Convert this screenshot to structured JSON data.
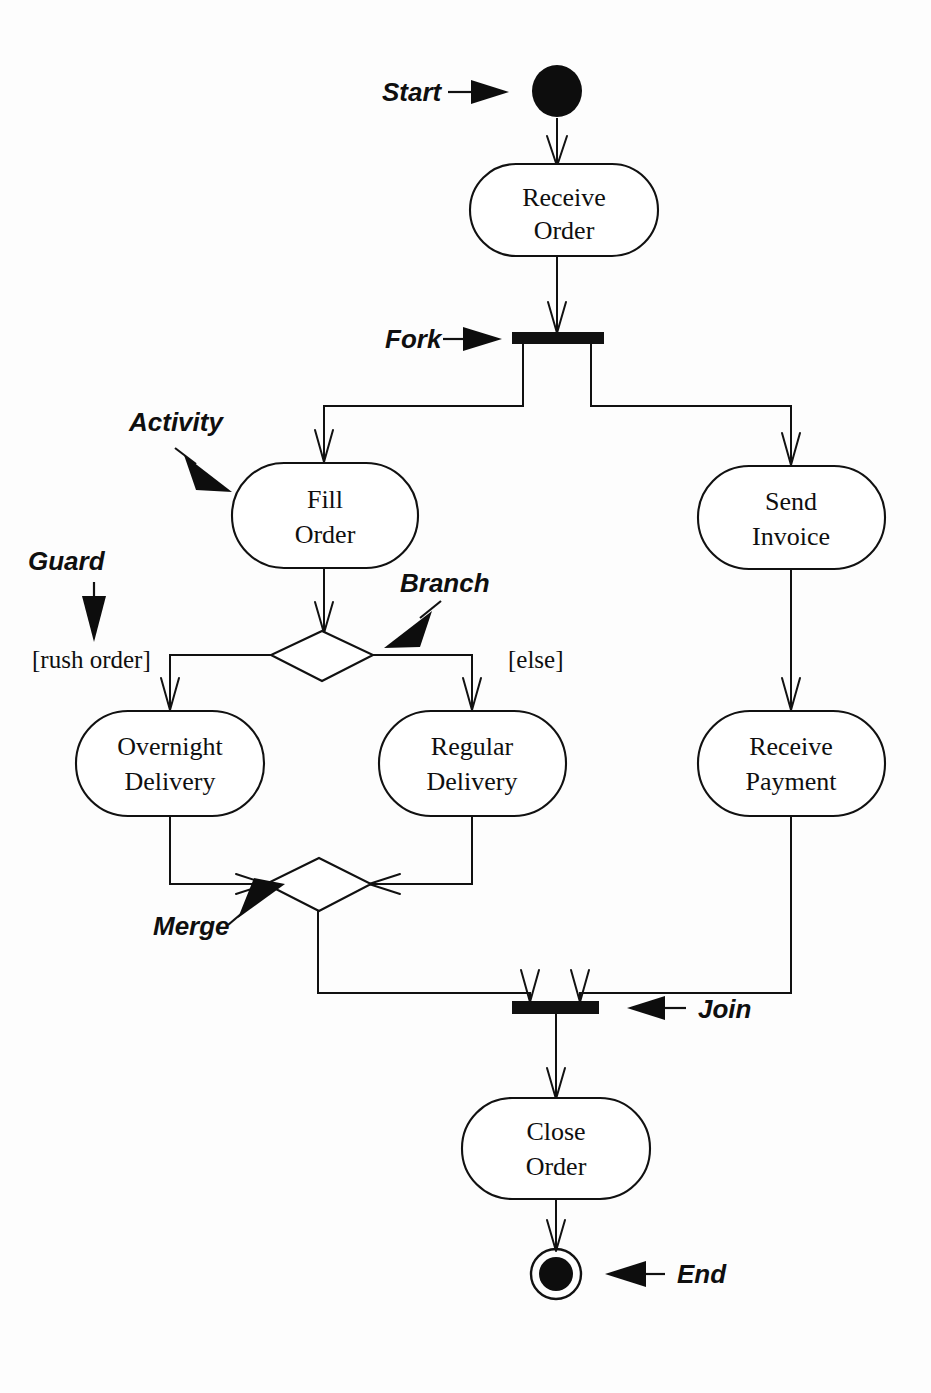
{
  "diagram": {
    "type": "uml-activity-diagram",
    "background_color": "#fdfdfd",
    "ink_color": "#111111",
    "width": 931,
    "height": 1393
  },
  "nodes": {
    "start": {
      "kind": "initial-node",
      "label": ""
    },
    "receive_order": {
      "kind": "activity",
      "label_line1": "Receive",
      "label_line2": "Order"
    },
    "fork": {
      "kind": "fork-bar",
      "label": ""
    },
    "fill_order": {
      "kind": "activity",
      "label_line1": "Fill",
      "label_line2": "Order"
    },
    "send_invoice": {
      "kind": "activity",
      "label_line1": "Send",
      "label_line2": "Invoice"
    },
    "branch": {
      "kind": "decision-diamond",
      "label": ""
    },
    "overnight_delivery": {
      "kind": "activity",
      "label_line1": "Overnight",
      "label_line2": "Delivery"
    },
    "regular_delivery": {
      "kind": "activity",
      "label_line1": "Regular",
      "label_line2": "Delivery"
    },
    "receive_payment": {
      "kind": "activity",
      "label_line1": "Receive",
      "label_line2": "Payment"
    },
    "merge": {
      "kind": "merge-diamond",
      "label": ""
    },
    "join": {
      "kind": "join-bar",
      "label": ""
    },
    "close_order": {
      "kind": "activity",
      "label_line1": "Close",
      "label_line2": "Order"
    },
    "end": {
      "kind": "final-node",
      "label": ""
    }
  },
  "guards": {
    "rush_order": "[rush order]",
    "else": "[else]"
  },
  "annotations": {
    "start": "Start",
    "fork": "Fork",
    "activity": "Activity",
    "guard": "Guard",
    "branch": "Branch",
    "merge": "Merge",
    "join": "Join",
    "end": "End"
  },
  "edges": [
    {
      "from": "start",
      "to": "receive_order"
    },
    {
      "from": "receive_order",
      "to": "fork"
    },
    {
      "from": "fork",
      "to": "fill_order"
    },
    {
      "from": "fork",
      "to": "send_invoice"
    },
    {
      "from": "fill_order",
      "to": "branch"
    },
    {
      "from": "branch",
      "to": "overnight_delivery",
      "guard": "[rush order]"
    },
    {
      "from": "branch",
      "to": "regular_delivery",
      "guard": "[else]"
    },
    {
      "from": "send_invoice",
      "to": "receive_payment"
    },
    {
      "from": "overnight_delivery",
      "to": "merge"
    },
    {
      "from": "regular_delivery",
      "to": "merge"
    },
    {
      "from": "merge",
      "to": "join"
    },
    {
      "from": "receive_payment",
      "to": "join"
    },
    {
      "from": "join",
      "to": "close_order"
    },
    {
      "from": "close_order",
      "to": "end"
    }
  ]
}
